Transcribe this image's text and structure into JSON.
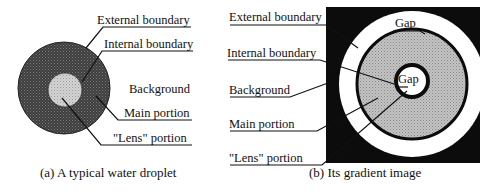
{
  "panel_a": {
    "caption": "(a) A typical water droplet",
    "labels": {
      "external_boundary": "External boundary",
      "internal_boundary": "Internal boundary",
      "background": "Background",
      "main_portion": "Main portion",
      "lens_portion": "\"Lens\" portion"
    }
  },
  "panel_b": {
    "caption": "(b) Its gradient image",
    "labels": {
      "external_boundary": "External boundary",
      "internal_boundary": "Internal boundary",
      "background": "Background",
      "main_portion": "Main portion",
      "lens_portion": "\"Lens\" portion",
      "gap_outer": "Gap",
      "gap_inner": "Gap"
    }
  },
  "colors": {
    "droplet_main": "#4a4a4a",
    "droplet_lens": "#d6d6d6",
    "gradient_background": "#0c0c0c",
    "gradient_gap": "#ffffff",
    "gradient_main": "#bdbdbd"
  }
}
